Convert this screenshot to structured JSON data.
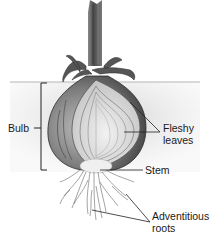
{
  "diagram": {
    "labels": {
      "bulb": "Bulb",
      "fleshy_leaves_line1": "Fleshy",
      "fleshy_leaves_line2": "leaves",
      "stem": "Stem",
      "adventitious_roots_line1": "Adventitious",
      "adventitious_roots_line2": "roots"
    },
    "colors": {
      "background": "#ffffff",
      "soil": "#d9d9d9",
      "bulb_dark": "#6e6e6e",
      "bulb_light": "#e6e6e6",
      "stem_shaft": "#5a5a5a",
      "leader_line": "#222222"
    }
  }
}
